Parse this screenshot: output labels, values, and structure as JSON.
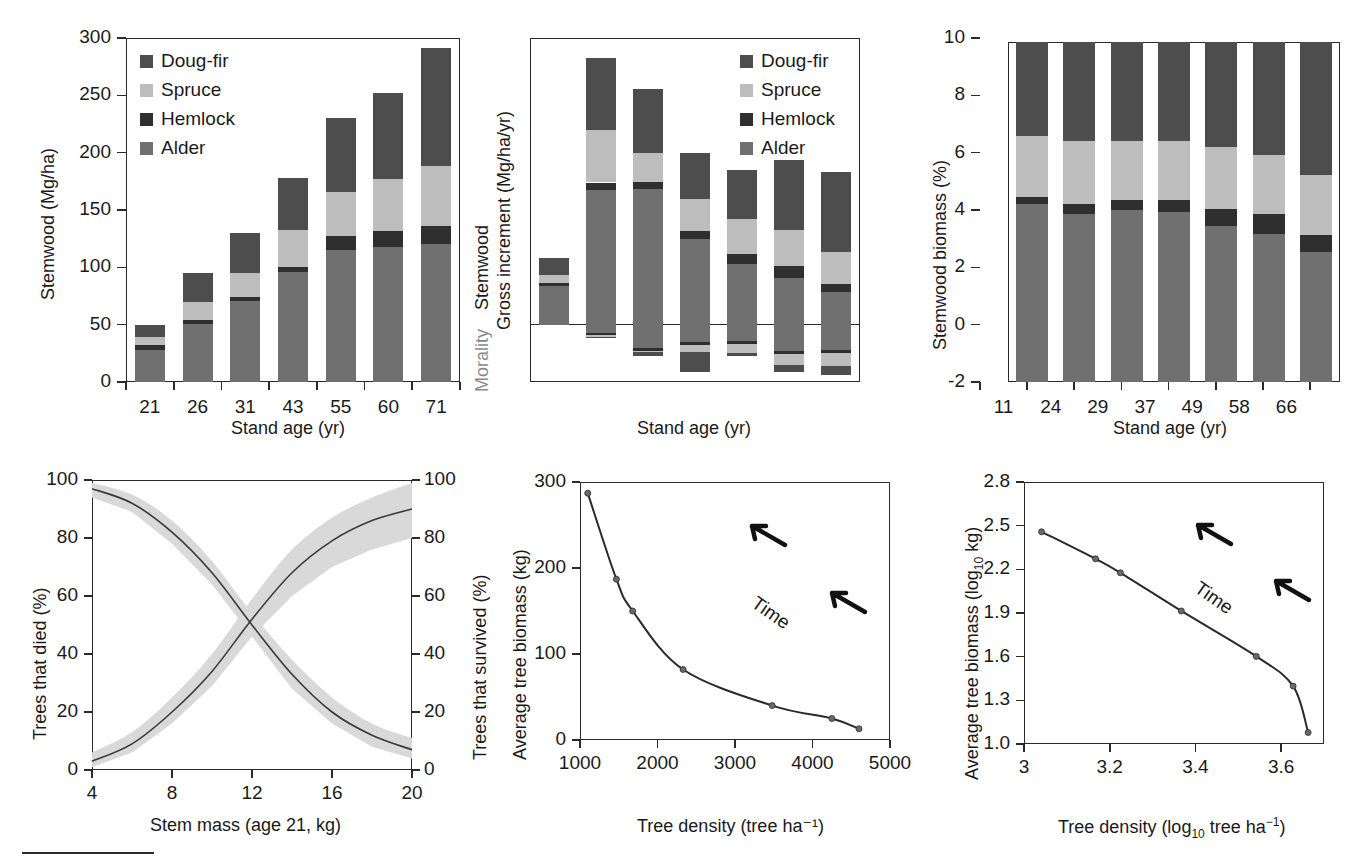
{
  "colors": {
    "doug_fir": "#4d4d4d",
    "spruce": "#bdbdbd",
    "hemlock": "#2f2f2f",
    "alder": "#707070",
    "axis": "#2a2a2a",
    "band": "#d9d9d9",
    "gray_text": "#8a8a8a"
  },
  "legend": {
    "items": [
      {
        "label": "Doug-fir",
        "color": "#4d4d4d"
      },
      {
        "label": "Spruce",
        "color": "#bdbdbd"
      },
      {
        "label": "Hemlock",
        "color": "#2f2f2f"
      },
      {
        "label": "Alder",
        "color": "#707070"
      }
    ]
  },
  "chart_data": [
    {
      "id": "panel-a-stemwood",
      "type": "bar",
      "stacked": true,
      "title": "",
      "xlabel": "Stand age (yr)",
      "ylabel": "Stemwood (Mg/ha)",
      "categories": [
        "21",
        "26",
        "31",
        "43",
        "55",
        "60",
        "71"
      ],
      "ylim": [
        0,
        300
      ],
      "yticks": [
        0,
        50,
        100,
        150,
        200,
        250,
        300
      ],
      "ytick_labels": [
        "0",
        "50",
        "100",
        "150",
        "200",
        "250",
        "300"
      ],
      "grid": false,
      "legend_position": "top-left",
      "series": [
        {
          "name": "Alder",
          "color": "#707070",
          "values": [
            28,
            51,
            71,
            96,
            115,
            118,
            120
          ]
        },
        {
          "name": "Hemlock",
          "color": "#2f2f2f",
          "values": [
            4,
            3,
            3,
            4,
            12,
            14,
            16
          ]
        },
        {
          "name": "Spruce",
          "color": "#bdbdbd",
          "values": [
            7,
            16,
            21,
            33,
            39,
            45,
            52
          ]
        },
        {
          "name": "Doug-fir",
          "color": "#4d4d4d",
          "values": [
            11,
            25,
            35,
            45,
            64,
            75,
            103
          ]
        }
      ],
      "totals": [
        50,
        95,
        130,
        178,
        230,
        252,
        291
      ]
    },
    {
      "id": "panel-b-increment",
      "type": "bar",
      "stacked": true,
      "title": "",
      "xlabel": "Stand age (yr)",
      "ylabel_top": "Stemwood",
      "ylabel_top2": "Gross increment (Mg/ha/yr)",
      "ylabel_bottom": "Morality",
      "categories": [
        "11",
        "24",
        "29",
        "37",
        "49",
        "58",
        "66"
      ],
      "ylim": [
        -2,
        10
      ],
      "yticks": [
        -2,
        0,
        2,
        4,
        6,
        8,
        10
      ],
      "ytick_labels": [
        "-2",
        "0",
        "2",
        "4",
        "6",
        "8",
        "10"
      ],
      "grid": false,
      "legend_position": "top-right",
      "gross_series": [
        {
          "name": "Alder",
          "color": "#707070",
          "values": [
            1.34,
            4.7,
            4.72,
            2.98,
            2.1,
            1.62,
            1.13
          ]
        },
        {
          "name": "Hemlock",
          "color": "#2f2f2f",
          "values": [
            0.1,
            0.26,
            0.26,
            0.28,
            0.35,
            0.42,
            0.3
          ]
        },
        {
          "name": "Spruce",
          "color": "#bdbdbd",
          "values": [
            0.28,
            1.82,
            1.02,
            1.12,
            1.22,
            1.25,
            1.12
          ]
        },
        {
          "name": "Doug-fir",
          "color": "#4d4d4d",
          "values": [
            0.59,
            2.52,
            2.22,
            1.62,
            1.72,
            2.46,
            2.78
          ]
        }
      ],
      "gross_totals": [
        2.31,
        9.3,
        8.22,
        6.0,
        5.39,
        5.75,
        5.33
      ],
      "mortality_series": [
        {
          "name": "Alder",
          "color": "#707070",
          "values": [
            0.0,
            0.3,
            0.82,
            0.6,
            0.58,
            0.92,
            0.88
          ]
        },
        {
          "name": "Hemlock",
          "color": "#2f2f2f",
          "values": [
            0.0,
            0.06,
            0.1,
            0.12,
            0.1,
            0.1,
            0.1
          ]
        },
        {
          "name": "Spruce",
          "color": "#bdbdbd",
          "values": [
            0.0,
            0.06,
            0.04,
            0.22,
            0.3,
            0.4,
            0.46
          ]
        },
        {
          "name": "Doug-fir",
          "color": "#4d4d4d",
          "values": [
            0.0,
            0.06,
            0.14,
            0.72,
            0.1,
            0.22,
            0.32
          ]
        }
      ],
      "mortality_totals": [
        0.0,
        0.48,
        1.1,
        1.66,
        1.08,
        1.64,
        1.76
      ]
    },
    {
      "id": "panel-c-percent",
      "type": "bar",
      "stacked": true,
      "title": "",
      "xlabel": "Stand age (yr)",
      "ylabel": "Stemwood biomass (%)",
      "categories": [
        "21",
        "26",
        "31",
        "43",
        "55",
        "60",
        "71"
      ],
      "ylim": [
        0,
        110
      ],
      "yticks": [
        0,
        20,
        40,
        60,
        80,
        100
      ],
      "ytick_labels": [
        "0",
        "20",
        "40",
        "60",
        "80",
        "100"
      ],
      "minor_yticks": [
        10,
        30,
        50,
        70,
        90,
        110
      ],
      "grid": false,
      "legend_position": "none",
      "series": [
        {
          "name": "Alder",
          "color": "#707070",
          "values": [
            57.5,
            54.5,
            55.5,
            55.0,
            50.5,
            48.0,
            42.0
          ]
        },
        {
          "name": "Hemlock",
          "color": "#2f2f2f",
          "values": [
            2.5,
            3.0,
            3.5,
            4.0,
            5.5,
            6.5,
            5.5
          ]
        },
        {
          "name": "Spruce",
          "color": "#bdbdbd",
          "values": [
            19.5,
            20.5,
            19.0,
            19.0,
            20.0,
            19.0,
            19.5
          ]
        },
        {
          "name": "Doug-fir",
          "color": "#4d4d4d",
          "values": [
            30.5,
            32.0,
            32.0,
            32.0,
            34.0,
            36.5,
            43.0
          ]
        }
      ]
    },
    {
      "id": "panel-d-survival",
      "type": "line",
      "title": "",
      "xlabel": "Stem mass (age 21, kg)",
      "ylabel_left": "Trees that died (%)",
      "ylabel_right": "Trees that survived (%)",
      "xlim": [
        4,
        20
      ],
      "xticks": [
        4,
        8,
        12,
        16,
        20
      ],
      "xtick_labels": [
        "4",
        "8",
        "12",
        "16",
        "20"
      ],
      "ylim": [
        0,
        100
      ],
      "yticks": [
        0,
        20,
        40,
        60,
        80,
        100
      ],
      "ytick_labels": [
        "0",
        "20",
        "40",
        "60",
        "80",
        "100"
      ],
      "grid": false,
      "legend_position": "none",
      "series": [
        {
          "name": "Trees that died (%)",
          "x": [
            4,
            6,
            8,
            10,
            12,
            14,
            16,
            18,
            20
          ],
          "values": [
            97,
            92,
            82,
            68,
            50,
            33,
            20,
            12,
            7
          ],
          "band_upper": [
            99,
            95,
            86,
            72,
            54,
            38,
            25,
            16,
            11
          ],
          "band_lower": [
            94,
            89,
            78,
            64,
            46,
            28,
            16,
            8,
            4
          ]
        },
        {
          "name": "Trees that survived (%)",
          "x": [
            4,
            6,
            8,
            10,
            12,
            14,
            16,
            18,
            20
          ],
          "values": [
            3,
            9,
            20,
            34,
            52,
            68,
            79,
            86,
            90
          ],
          "band_upper": [
            6,
            13,
            25,
            40,
            59,
            76,
            87,
            94,
            99
          ],
          "band_lower": [
            1,
            6,
            16,
            29,
            46,
            60,
            70,
            76,
            80
          ]
        }
      ]
    },
    {
      "id": "panel-e-density-biomass",
      "type": "line",
      "title": "",
      "xlabel": "Tree density (tree ha⁻¹)",
      "ylabel": "Average tree biomass (kg)",
      "xlim": [
        1000,
        5000
      ],
      "xticks": [
        1000,
        2000,
        3000,
        4000,
        5000
      ],
      "xtick_labels": [
        "1000",
        "2000",
        "3000",
        "4000",
        "5000"
      ],
      "ylim": [
        0,
        300
      ],
      "yticks": [
        0,
        100,
        200,
        300
      ],
      "ytick_labels": [
        "0",
        "100",
        "200",
        "300"
      ],
      "grid": false,
      "legend_position": "none",
      "annotation": "Time",
      "markers": true,
      "x": [
        1100,
        1470,
        1680,
        2330,
        3480,
        4250,
        4600
      ],
      "values": [
        287,
        187,
        150,
        82,
        40,
        25,
        13
      ]
    },
    {
      "id": "panel-f-density-biomass-log",
      "type": "line",
      "title": "",
      "xlabel": "Tree density (log₁₀ tree ha⁻¹)",
      "ylabel": "Average tree biomass (log₁₀ kg)",
      "xlim": [
        3.0,
        3.7
      ],
      "xticks": [
        3.0,
        3.2,
        3.4,
        3.6
      ],
      "xtick_labels": [
        "3",
        "3.2",
        "3.4",
        "3.6"
      ],
      "ylim": [
        1.0,
        2.8
      ],
      "yticks": [
        1.0,
        1.3,
        1.6,
        1.9,
        2.2,
        2.5,
        2.8
      ],
      "ytick_labels": [
        "1.0",
        "1.3",
        "1.6",
        "1.9",
        "2.2",
        "2.5",
        "2.8"
      ],
      "grid": false,
      "legend_position": "none",
      "annotation": "Time",
      "markers": true,
      "x": [
        3.041,
        3.167,
        3.225,
        3.367,
        3.542,
        3.628,
        3.663
      ],
      "values": [
        2.458,
        2.272,
        2.176,
        1.914,
        1.602,
        1.398,
        1.079
      ]
    }
  ]
}
